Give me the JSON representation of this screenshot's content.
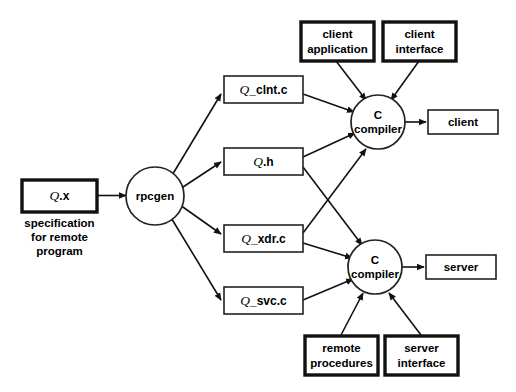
{
  "diagram": {
    "colors": {
      "background": "#ffffff",
      "stroke": "#111111",
      "box_fill": "#ffffff",
      "text": "#000000"
    },
    "input": {
      "spec_box": {
        "q": "Q",
        "rest": ".x"
      },
      "caption_line1": "specification",
      "caption_line2": "for remote",
      "caption_line3": "program"
    },
    "generator": {
      "label": "rpcgen"
    },
    "generated_files": [
      {
        "q": "Q",
        "rest": "_clnt.c"
      },
      {
        "q": "Q",
        "rest": ".h"
      },
      {
        "q": "Q",
        "rest": "_xdr.c"
      },
      {
        "q": "Q",
        "rest": "_svc.c"
      }
    ],
    "compilers": [
      {
        "line1": "C",
        "line2": "compiler"
      },
      {
        "line1": "C",
        "line2": "compiler"
      }
    ],
    "user_sources_top": [
      {
        "line1": "client",
        "line2": "application"
      },
      {
        "line1": "client",
        "line2": "interface"
      }
    ],
    "user_sources_bottom": [
      {
        "line1": "remote",
        "line2": "procedures"
      },
      {
        "line1": "server",
        "line2": "interface"
      }
    ],
    "outputs": [
      {
        "label": "client"
      },
      {
        "label": "server"
      }
    ]
  }
}
